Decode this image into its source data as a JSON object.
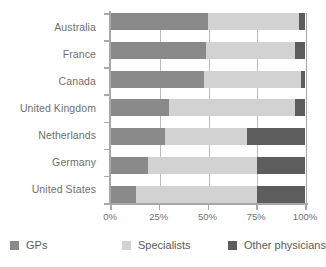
{
  "chart_data": {
    "type": "bar",
    "orientation": "horizontal",
    "stacked": true,
    "normalized": "100%",
    "title": "",
    "subtitle": "",
    "xlabel": "",
    "ylabel": "",
    "categories": [
      "Australia",
      "France",
      "Canada",
      "United Kingdom",
      "Netherlands",
      "Germany",
      "United States"
    ],
    "series": [
      {
        "name": "GPs",
        "color": "#8a8a8a",
        "values": [
          50,
          49,
          48,
          30,
          28,
          19,
          13
        ]
      },
      {
        "name": "Specialists",
        "color": "#d2d2d2",
        "values": [
          47,
          46,
          50,
          65,
          42,
          56,
          62
        ]
      },
      {
        "name": "Other physicians",
        "color": "#5d5d5d",
        "values": [
          3,
          5,
          2,
          5,
          30,
          25,
          25
        ]
      }
    ],
    "xticks": [
      "0%",
      "25%",
      "50%",
      "75%",
      "100%"
    ],
    "xtick_values": [
      0,
      25,
      50,
      75,
      100
    ],
    "xlim": [
      0,
      100
    ],
    "grid": true,
    "legend_position": "bottom",
    "legend": [
      "GPs",
      "Specialists",
      "Other physicians"
    ]
  },
  "axis": {
    "x_ticks": [
      {
        "label": "0%",
        "value": 0
      },
      {
        "label": "25%",
        "value": 25
      },
      {
        "label": "50%",
        "value": 50
      },
      {
        "label": "75%",
        "value": 75
      },
      {
        "label": "100%",
        "value": 100
      }
    ]
  },
  "legend": {
    "items": [
      {
        "label": "GPs",
        "color": "#8a8a8a"
      },
      {
        "label": "Specialists",
        "color": "#d2d2d2"
      },
      {
        "label": "Other physicians",
        "color": "#5d5d5d"
      }
    ]
  },
  "colors": {
    "gps": "#8a8a8a",
    "specialists": "#d2d2d2",
    "other_physicians": "#5d5d5d",
    "axis": "#a8a8a8",
    "gridline": "#bcbcbc",
    "text": "#6f6f6f",
    "background": "#ffffff"
  }
}
